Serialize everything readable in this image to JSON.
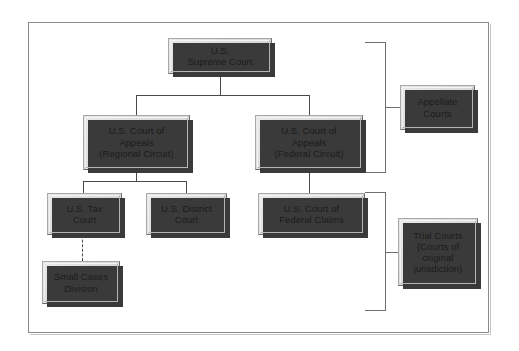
{
  "diagram": {
    "frame": {
      "border_color": "#8c8c8c",
      "background": "#ffffff"
    },
    "node_style": {
      "fill": "#dedede",
      "border_dark": "#6b6b6b",
      "border_light": "#a8a8a8",
      "shadow": "#3a3a3a",
      "text_color": "#1a1a1a"
    },
    "connector_color": "#4a4a4a",
    "bracket_color": "#6e6e6e"
  },
  "nodes": {
    "supreme": {
      "label": "U.S.\nSupreme Court",
      "level": "supreme"
    },
    "appeals_regional": {
      "label": "U.S. Court of\nAppeals\n(Regional Circuit)",
      "level": "appellate"
    },
    "appeals_federal": {
      "label": "U.S. Court of\nAppeals\n(Federal Circuit)",
      "level": "appellate"
    },
    "tax_court": {
      "label": "U.S. Tax\nCourt",
      "level": "trial"
    },
    "district_court": {
      "label": "U.S. District\nCourt",
      "level": "trial"
    },
    "federal_claims": {
      "label": "U.S. Court of\nFederal Claims",
      "level": "trial"
    },
    "small_cases": {
      "label": "Small Cases\nDivision",
      "level": "sub-trial"
    }
  },
  "group_labels": {
    "appellate": {
      "label": "Appellate\nCourts"
    },
    "trial": {
      "label": "Trial Courts\n(Courts of\noriginal\njurisdiction)"
    }
  },
  "connections": [
    {
      "from": "supreme",
      "to": "appeals_regional",
      "style": "solid"
    },
    {
      "from": "supreme",
      "to": "appeals_federal",
      "style": "solid"
    },
    {
      "from": "appeals_regional",
      "to": "tax_court",
      "style": "solid"
    },
    {
      "from": "appeals_regional",
      "to": "district_court",
      "style": "solid"
    },
    {
      "from": "appeals_federal",
      "to": "federal_claims",
      "style": "solid"
    },
    {
      "from": "tax_court",
      "to": "small_cases",
      "style": "dashed"
    }
  ],
  "brackets": [
    {
      "name": "appellate-bracket",
      "spans": [
        "supreme",
        "appeals_regional",
        "appeals_federal"
      ],
      "label": "Appellate\nCourts"
    },
    {
      "name": "trial-bracket",
      "spans": [
        "tax_court",
        "district_court",
        "federal_claims",
        "small_cases"
      ],
      "label": "Trial Courts\n(Courts of\noriginal\njurisdiction)"
    }
  ]
}
